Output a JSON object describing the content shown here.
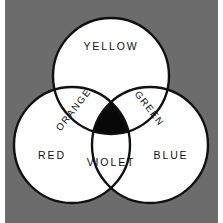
{
  "diagram": {
    "background_color": "#6c6c6c",
    "circle_fill": "#ffffff",
    "circle_stroke": "#101010",
    "intersection_fill": "#080808",
    "regions": [
      {
        "key": "yellow",
        "label": "YELLOW",
        "rotation": 0,
        "cx": 111,
        "cy": 47
      },
      {
        "key": "red",
        "label": "RED",
        "rotation": 0,
        "cx": 52,
        "cy": 156
      },
      {
        "key": "blue",
        "label": "BLUE",
        "rotation": 0,
        "cx": 171,
        "cy": 156
      },
      {
        "key": "violet",
        "label": "VIOLET",
        "rotation": 0,
        "cx": 111,
        "cy": 163
      },
      {
        "key": "orange",
        "label": "ORANGE",
        "rotation": -52,
        "cx": 74,
        "cy": 110
      },
      {
        "key": "green",
        "label": "GREEN",
        "rotation": 52,
        "cx": 149,
        "cy": 109
      }
    ],
    "circles": [
      {
        "key": "circle-top",
        "cx": 111,
        "cy": 76,
        "r": 58
      },
      {
        "key": "circle-bottom-left",
        "cx": 72,
        "cy": 145,
        "r": 58
      },
      {
        "key": "circle-bottom-right",
        "cx": 150,
        "cy": 145,
        "r": 58
      }
    ]
  }
}
